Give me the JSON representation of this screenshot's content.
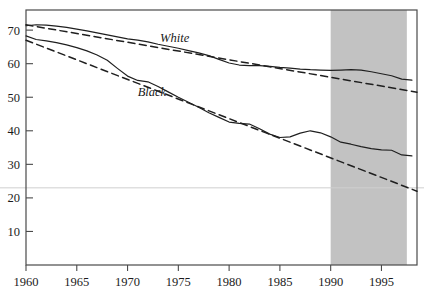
{
  "figure": {
    "background_color": "#ffffff",
    "frame_color": "#4a4a4a",
    "shade_color": "#c2c2c2",
    "line_color": "#1f1f1f",
    "gridline_color": "#cfcfcf",
    "cropped_title_remnant": "",
    "white_label": "White",
    "black_label": "Black"
  },
  "chart_data": {
    "type": "line",
    "title": "",
    "subtitle": "",
    "xlabel": "",
    "ylabel": "",
    "xlim": [
      1960,
      1998.5
    ],
    "ylim": [
      0,
      76
    ],
    "grid": true,
    "gridlines_y": [
      23
    ],
    "legend_position": "inline-annotations",
    "xticks": [
      1960,
      1965,
      1970,
      1975,
      1980,
      1985,
      1990,
      1995
    ],
    "xtick_labels": [
      "1960",
      "1965",
      "1970",
      "1975",
      "1980",
      "1985",
      "1990",
      "1995"
    ],
    "yticks": [
      10,
      20,
      30,
      40,
      50,
      60,
      70
    ],
    "ytick_labels": [
      "10",
      "20",
      "30",
      "40",
      "50",
      "60",
      "70"
    ],
    "shaded_region": {
      "label": "",
      "x_start": 1990,
      "x_end": 1997.5,
      "color": "#c2c2c2"
    },
    "annotations": [
      {
        "text": "White",
        "x": 1973.2,
        "y": 66.5,
        "style": "italic"
      },
      {
        "text": "Black",
        "x": 1971.0,
        "y": 50.5,
        "style": "italic"
      }
    ],
    "series": [
      {
        "name": "White",
        "style": "solid",
        "color": "#1f1f1f",
        "x": [
          1960,
          1961,
          1962,
          1963,
          1964,
          1965,
          1966,
          1967,
          1968,
          1969,
          1970,
          1971,
          1972,
          1973,
          1974,
          1975,
          1976,
          1977,
          1978,
          1979,
          1980,
          1981,
          1982,
          1983,
          1984,
          1985,
          1986,
          1987,
          1988,
          1989,
          1990,
          1991,
          1992,
          1993,
          1994,
          1995,
          1996,
          1997,
          1998
        ],
        "values": [
          71.3,
          71.6,
          71.5,
          71.2,
          70.8,
          70.3,
          69.8,
          69.2,
          68.6,
          68.0,
          67.4,
          67.0,
          66.5,
          65.8,
          65.2,
          64.6,
          63.9,
          63.2,
          62.4,
          61.3,
          60.2,
          59.6,
          59.4,
          59.4,
          59.2,
          58.9,
          58.7,
          58.4,
          58.2,
          58.1,
          58.0,
          58.1,
          58.2,
          58.1,
          57.6,
          57.0,
          56.4,
          55.4,
          55.1
        ]
      },
      {
        "name": "White trend",
        "style": "dashed",
        "color": "#1f1f1f",
        "x": [
          1960,
          1998.5
        ],
        "values": [
          71.6,
          51.5
        ]
      },
      {
        "name": "Black",
        "style": "solid",
        "color": "#1f1f1f",
        "x": [
          1960,
          1961,
          1962,
          1963,
          1964,
          1965,
          1966,
          1967,
          1968,
          1969,
          1970,
          1971,
          1972,
          1973,
          1974,
          1975,
          1976,
          1977,
          1978,
          1979,
          1980,
          1981,
          1982,
          1983,
          1984,
          1985,
          1986,
          1987,
          1988,
          1989,
          1990,
          1991,
          1992,
          1993,
          1994,
          1995,
          1996,
          1997,
          1998
        ],
        "values": [
          68.3,
          67.2,
          66.8,
          66.3,
          65.6,
          64.8,
          63.8,
          62.6,
          61.0,
          58.6,
          56.3,
          55.0,
          54.6,
          53.2,
          51.6,
          50.0,
          48.5,
          47.0,
          45.4,
          44.0,
          42.6,
          42.2,
          42.0,
          40.6,
          39.0,
          38.0,
          38.2,
          39.3,
          40.0,
          39.4,
          38.2,
          36.6,
          36.0,
          35.3,
          34.7,
          34.3,
          34.2,
          32.8,
          32.5
        ]
      },
      {
        "name": "Black trend",
        "style": "dashed",
        "color": "#1f1f1f",
        "x": [
          1960,
          1998.5
        ],
        "values": [
          67.0,
          22.0
        ]
      }
    ]
  }
}
